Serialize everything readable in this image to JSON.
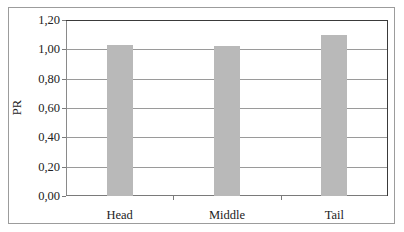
{
  "chart_data": {
    "type": "bar",
    "title": "",
    "xlabel": "",
    "ylabel": "PR",
    "categories": [
      "Head",
      "Middle",
      "Tail"
    ],
    "values": [
      1.03,
      1.02,
      1.1
    ],
    "ylim": [
      0,
      1.2
    ],
    "yticks": [
      "0,00",
      "0,20",
      "0,40",
      "0,60",
      "0,80",
      "1,00",
      "1,20"
    ],
    "ytick_values": [
      0,
      0.2,
      0.4,
      0.6,
      0.8,
      1.0,
      1.2
    ],
    "grid": true,
    "legend": null,
    "colors": {
      "bar": "#b9b9b9",
      "grid": "#9a9a9a",
      "frame": "#9c9c9c",
      "plot_border": "#3a3a3a"
    }
  }
}
